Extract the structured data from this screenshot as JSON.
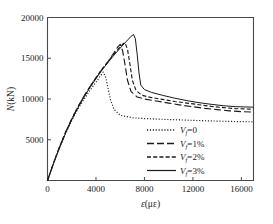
{
  "chart_data": {
    "type": "line",
    "title": "",
    "xlabel": "ε(με)",
    "ylabel": "N(kN)",
    "xlim": [
      0,
      17000
    ],
    "ylim": [
      0,
      20000
    ],
    "xticks": [
      0,
      4000,
      8000,
      12000,
      16000
    ],
    "xtick_labels": [
      "0",
      "4000",
      "8000",
      "12000",
      "16000"
    ],
    "yticks": [
      5000,
      10000,
      15000,
      20000
    ],
    "ytick_labels": [
      "5000",
      "10000",
      "15000",
      "20000"
    ],
    "grid": false,
    "legend_position": "lower-center-right",
    "series": [
      {
        "name": "V_f=0",
        "label": "V",
        "sub": "f",
        "suffix": "=0",
        "style": "dotted",
        "peak_x": 4600,
        "peak_y": 13300,
        "end_y": 7200,
        "points": [
          [
            0,
            0
          ],
          [
            500,
            2100
          ],
          [
            1000,
            4050
          ],
          [
            1500,
            5800
          ],
          [
            2000,
            7350
          ],
          [
            2500,
            8750
          ],
          [
            3000,
            9950
          ],
          [
            3500,
            11050
          ],
          [
            4000,
            12050
          ],
          [
            4400,
            12900
          ],
          [
            4600,
            13300
          ],
          [
            4800,
            12700
          ],
          [
            5000,
            11300
          ],
          [
            5200,
            9900
          ],
          [
            5500,
            8700
          ],
          [
            6000,
            8000
          ],
          [
            7000,
            7700
          ],
          [
            8000,
            7600
          ],
          [
            10000,
            7480
          ],
          [
            12000,
            7380
          ],
          [
            14000,
            7290
          ],
          [
            16000,
            7220
          ],
          [
            17000,
            7200
          ]
        ]
      },
      {
        "name": "V_f=1%",
        "label": "V",
        "sub": "f",
        "suffix": "=1%",
        "style": "long-dash",
        "peak_x": 6000,
        "peak_y": 16700,
        "end_y": 8400,
        "points": [
          [
            0,
            0
          ],
          [
            500,
            2150
          ],
          [
            1000,
            4150
          ],
          [
            1500,
            5950
          ],
          [
            2000,
            7550
          ],
          [
            2500,
            9000
          ],
          [
            3000,
            10300
          ],
          [
            3500,
            11500
          ],
          [
            4000,
            12600
          ],
          [
            4500,
            13650
          ],
          [
            5000,
            14600
          ],
          [
            5500,
            15700
          ],
          [
            5800,
            16400
          ],
          [
            6000,
            16700
          ],
          [
            6200,
            15900
          ],
          [
            6400,
            14200
          ],
          [
            6600,
            12300
          ],
          [
            6900,
            10900
          ],
          [
            7400,
            10250
          ],
          [
            8000,
            10000
          ],
          [
            9000,
            9750
          ],
          [
            10000,
            9500
          ],
          [
            11000,
            9250
          ],
          [
            12000,
            9050
          ],
          [
            13000,
            8850
          ],
          [
            14000,
            8700
          ],
          [
            15000,
            8550
          ],
          [
            16000,
            8450
          ],
          [
            17000,
            8400
          ]
        ]
      },
      {
        "name": "V_f=2%",
        "label": "V",
        "sub": "f",
        "suffix": "=2%",
        "style": "short-dash",
        "peak_x": 6400,
        "peak_y": 16900,
        "end_y": 8750,
        "points": [
          [
            0,
            0
          ],
          [
            500,
            2150
          ],
          [
            1000,
            4150
          ],
          [
            1500,
            5950
          ],
          [
            2000,
            7550
          ],
          [
            2500,
            9000
          ],
          [
            3000,
            10300
          ],
          [
            3500,
            11500
          ],
          [
            4000,
            12600
          ],
          [
            4500,
            13650
          ],
          [
            5000,
            14600
          ],
          [
            5500,
            15550
          ],
          [
            6000,
            16400
          ],
          [
            6250,
            16800
          ],
          [
            6400,
            16900
          ],
          [
            6600,
            16100
          ],
          [
            6800,
            14300
          ],
          [
            7000,
            12300
          ],
          [
            7300,
            11050
          ],
          [
            7800,
            10450
          ],
          [
            8500,
            10200
          ],
          [
            9500,
            9950
          ],
          [
            10500,
            9700
          ],
          [
            11500,
            9500
          ],
          [
            12500,
            9300
          ],
          [
            13500,
            9100
          ],
          [
            14500,
            8950
          ],
          [
            15500,
            8820
          ],
          [
            17000,
            8750
          ]
        ]
      },
      {
        "name": "V_f=3%",
        "label": "V",
        "sub": "f",
        "suffix": "=3%",
        "style": "solid",
        "peak_x": 7100,
        "peak_y": 17900,
        "end_y": 9000,
        "points": [
          [
            0,
            0
          ],
          [
            500,
            2100
          ],
          [
            1000,
            4050
          ],
          [
            1500,
            5850
          ],
          [
            2000,
            7450
          ],
          [
            2500,
            8900
          ],
          [
            3000,
            10200
          ],
          [
            3500,
            11400
          ],
          [
            4000,
            12500
          ],
          [
            4500,
            13550
          ],
          [
            5000,
            14500
          ],
          [
            5500,
            15400
          ],
          [
            6000,
            16250
          ],
          [
            6500,
            17050
          ],
          [
            6900,
            17700
          ],
          [
            7100,
            17900
          ],
          [
            7250,
            17400
          ],
          [
            7400,
            15500
          ],
          [
            7550,
            13200
          ],
          [
            7700,
            11700
          ],
          [
            8000,
            11150
          ],
          [
            8600,
            10800
          ],
          [
            9500,
            10450
          ],
          [
            10500,
            10100
          ],
          [
            11500,
            9800
          ],
          [
            12500,
            9550
          ],
          [
            13500,
            9350
          ],
          [
            14500,
            9180
          ],
          [
            15500,
            9060
          ],
          [
            17000,
            9000
          ]
        ]
      }
    ]
  },
  "legend": {
    "items": [
      {
        "text_main": "V",
        "text_sub": "f",
        "text_rest": "=0"
      },
      {
        "text_main": "V",
        "text_sub": "f",
        "text_rest": "=1%"
      },
      {
        "text_main": "V",
        "text_sub": "f",
        "text_rest": "=2%"
      },
      {
        "text_main": "V",
        "text_sub": "f",
        "text_rest": "=3%"
      }
    ]
  },
  "axes": {
    "y_title_main": "N",
    "y_title_rest": "(kN)",
    "x_title_main": "ε",
    "x_title_rest": "(με)"
  },
  "colors": {
    "line": "#1a1a1a",
    "axis": "#4a4a4a",
    "background": "#ffffff"
  }
}
